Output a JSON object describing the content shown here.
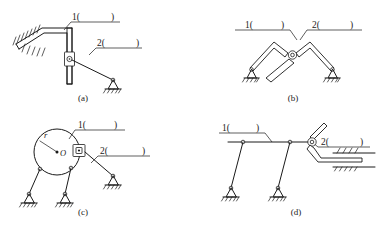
{
  "sheet": {
    "title": "Planar mechanism kinematic sketches exercise",
    "background_color": "#ffffff",
    "ink_color": "#1a1a1a",
    "width": 386,
    "height": 225
  },
  "figures": [
    {
      "id": "a",
      "caption": "(a)",
      "labels": [
        {
          "name": "link-1-label",
          "text": "1(",
          "close": ")"
        },
        {
          "name": "link-2-label",
          "text": "2(",
          "close": ")"
        }
      ],
      "parts": [
        "fixed-inclined-guide",
        "bent-slider-bar",
        "slider-block",
        "pin-joint",
        "link-2-rod",
        "ground-pivot-support"
      ]
    },
    {
      "id": "b",
      "caption": "(b)",
      "labels": [
        {
          "name": "link-1-label",
          "text": "1(",
          "close": ")"
        },
        {
          "name": "link-2-label",
          "text": "2(",
          "close": ")"
        }
      ],
      "parts": [
        "left-bent-link",
        "right-bent-link",
        "center-pin-joint",
        "lower-slider-bar",
        "left-ground-pivot",
        "right-ground-pivot"
      ]
    },
    {
      "id": "c",
      "caption": "(c)",
      "labels": [
        {
          "name": "link-1-label",
          "text": "1(",
          "close": ")"
        },
        {
          "name": "link-2-label",
          "text": "2(",
          "close": ")"
        },
        {
          "name": "radius-label",
          "text": "r"
        },
        {
          "name": "center-label",
          "text": "O"
        }
      ],
      "parts": [
        "disc-body",
        "center-point",
        "radius-line",
        "square-slider-block",
        "left-leg",
        "middle-leg",
        "right-link",
        "ground-pivot-left",
        "ground-pivot-middle",
        "ground-pivot-right"
      ]
    },
    {
      "id": "d",
      "caption": "(d)",
      "labels": [
        {
          "name": "link-1-label",
          "text": "1(",
          "close": ")"
        },
        {
          "name": "link-2-label",
          "text": "2(",
          "close": ")"
        }
      ],
      "parts": [
        "horizontal-coupler-bar",
        "left-leg",
        "middle-leg",
        "pin-joint-right",
        "bent-slider-rod",
        "horizontal-prismatic-guide",
        "ground-pivot-left",
        "ground-pivot-middle"
      ]
    }
  ]
}
